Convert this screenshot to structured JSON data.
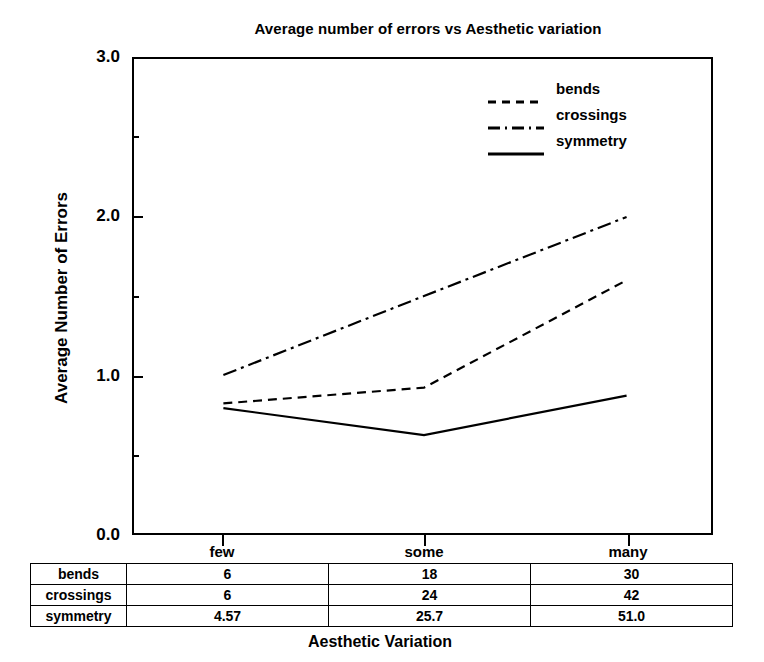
{
  "chart_data": {
    "type": "line",
    "title": "Average number of errors vs Aesthetic variation",
    "xlabel": "Aesthetic Variation",
    "ylabel": "Average Number of Errors",
    "categories": [
      "few",
      "some",
      "many"
    ],
    "ylim": [
      0.0,
      3.0
    ],
    "ytick_labels": [
      "0.0",
      "1.0",
      "2.0",
      "3.0"
    ],
    "ytick_values": [
      0.0,
      1.0,
      2.0,
      3.0
    ],
    "yminor_tick_values": [
      0.5,
      1.5,
      2.5
    ],
    "grid": false,
    "legend_position": "upper center",
    "series": [
      {
        "name": "bends",
        "style": "dashed",
        "values": [
          0.82,
          0.92,
          1.6
        ]
      },
      {
        "name": "crossings",
        "style": "dash-dot",
        "values": [
          1.0,
          1.5,
          2.0
        ]
      },
      {
        "name": "symmetry",
        "style": "solid",
        "values": [
          0.79,
          0.62,
          0.87
        ]
      }
    ],
    "table": {
      "row_headers": [
        "bends",
        "crossings",
        "symmetry"
      ],
      "column_headers": [
        "few",
        "some",
        "many"
      ],
      "rows": [
        [
          "6",
          "18",
          "30"
        ],
        [
          "6",
          "24",
          "42"
        ],
        [
          "4.57",
          "25.7",
          "51.0"
        ]
      ]
    }
  },
  "colors": {
    "line": "#000000",
    "background": "#ffffff",
    "axis": "#000000"
  }
}
